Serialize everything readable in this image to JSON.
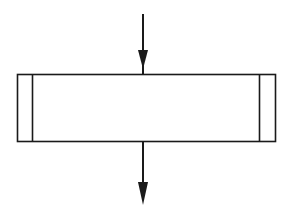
{
  "diagram": {
    "type": "flowchart-predefined-process-symbol",
    "background": "#ffffff",
    "stroke": "#1a1a1a",
    "label": "",
    "box": {
      "x": 17,
      "y": 74,
      "width": 258,
      "height": 67
    },
    "inner_lines": [
      {
        "x": 32
      },
      {
        "x": 259
      }
    ],
    "arrows": [
      {
        "name": "incoming-arrow",
        "x": 143,
        "y1": 14,
        "y2": 74,
        "direction": "down"
      },
      {
        "name": "outgoing-arrow",
        "x": 143,
        "y1": 141,
        "y2": 205,
        "direction": "down"
      }
    ]
  }
}
